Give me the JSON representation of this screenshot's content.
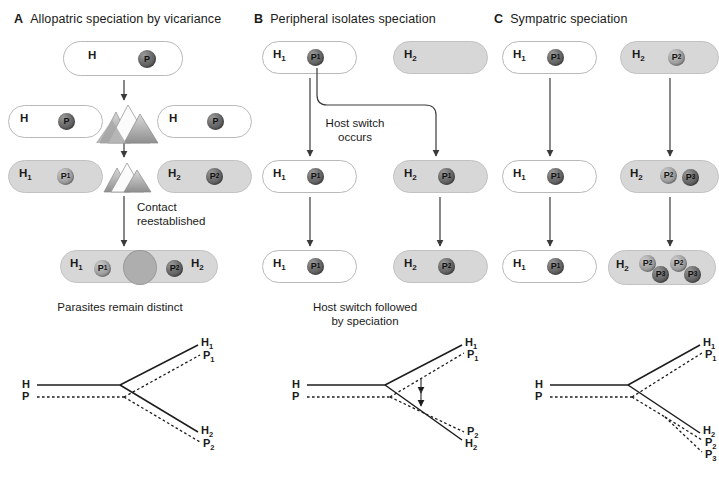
{
  "figure": {
    "panels": [
      {
        "letter": "A",
        "title": "Allopatric speciation by vicariance",
        "caption": "Parasites remain distinct",
        "arrow_labels": [
          "Contact\nreestablished"
        ],
        "stages": [
          {
            "hosts": [
              {
                "label": "H",
                "shaded": false,
                "parasites": [
                  {
                    "label": "P",
                    "tone": "dark"
                  }
                ]
              }
            ]
          },
          {
            "hosts": [
              {
                "label": "H",
                "shaded": false,
                "parasites": [
                  {
                    "label": "P",
                    "tone": "dark"
                  }
                ]
              },
              {
                "label": "H",
                "shaded": false,
                "parasites": [
                  {
                    "label": "P",
                    "tone": "dark"
                  }
                ]
              }
            ]
          },
          {
            "hosts": [
              {
                "label": "H1",
                "shaded": true,
                "parasites": [
                  {
                    "label": "P1",
                    "tone": "mid"
                  }
                ]
              },
              {
                "label": "H2",
                "shaded": true,
                "parasites": [
                  {
                    "label": "P2",
                    "tone": "dark"
                  }
                ]
              }
            ]
          },
          {
            "hosts": [
              {
                "label": "H1",
                "shaded": true,
                "parasites": [
                  {
                    "label": "P1",
                    "tone": "mid"
                  }
                ]
              },
              {
                "label": "H2",
                "shaded": true,
                "parasites": [
                  {
                    "label": "P2",
                    "tone": "dark"
                  }
                ]
              }
            ]
          }
        ],
        "tree": {
          "root_labels": [
            "H",
            "P"
          ],
          "tip_upper": [
            "H1",
            "P1"
          ],
          "tip_lower": [
            "H2",
            "P2"
          ],
          "host_line": "solid",
          "parasite_line": "dashed",
          "switch_arrows": 0
        }
      },
      {
        "letter": "B",
        "title": "Peripheral isolates speciation",
        "caption": "Host switch followed\nby speciation",
        "arrow_labels": [
          "Host switch\noccurs"
        ],
        "stages": [
          {
            "hosts": [
              {
                "label": "H1",
                "shaded": false,
                "parasites": [
                  {
                    "label": "P1",
                    "tone": "dark"
                  }
                ]
              },
              {
                "label": "H2",
                "shaded": true,
                "parasites": []
              }
            ]
          },
          {
            "hosts": [
              {
                "label": "H1",
                "shaded": false,
                "parasites": [
                  {
                    "label": "P1",
                    "tone": "dark"
                  }
                ]
              },
              {
                "label": "H2",
                "shaded": true,
                "parasites": [
                  {
                    "label": "P1",
                    "tone": "dark"
                  }
                ]
              }
            ]
          },
          {
            "hosts": [
              {
                "label": "H1",
                "shaded": false,
                "parasites": [
                  {
                    "label": "P1",
                    "tone": "dark"
                  }
                ]
              },
              {
                "label": "H2",
                "shaded": true,
                "parasites": [
                  {
                    "label": "P2",
                    "tone": "dark"
                  }
                ]
              }
            ]
          }
        ],
        "tree": {
          "root_labels": [
            "H",
            "P"
          ],
          "tip_upper": [
            "H1",
            "P1"
          ],
          "tip_lower": [
            "P2",
            "H2"
          ],
          "host_line": "solid",
          "parasite_line": "dashed",
          "switch_arrows": 2
        }
      },
      {
        "letter": "C",
        "title": "Sympatric speciation",
        "caption": "",
        "arrow_labels": [],
        "stages": [
          {
            "hosts": [
              {
                "label": "H1",
                "shaded": false,
                "parasites": [
                  {
                    "label": "P1",
                    "tone": "dark"
                  }
                ]
              },
              {
                "label": "H2",
                "shaded": true,
                "parasites": [
                  {
                    "label": "P2",
                    "tone": "mid"
                  }
                ]
              }
            ]
          },
          {
            "hosts": [
              {
                "label": "H1",
                "shaded": false,
                "parasites": [
                  {
                    "label": "P1",
                    "tone": "dark"
                  }
                ]
              },
              {
                "label": "H2",
                "shaded": true,
                "parasites": [
                  {
                    "label": "P2",
                    "tone": "mid"
                  },
                  {
                    "label": "P3",
                    "tone": "dark"
                  }
                ]
              }
            ]
          },
          {
            "hosts": [
              {
                "label": "H1",
                "shaded": false,
                "parasites": [
                  {
                    "label": "P1",
                    "tone": "dark"
                  }
                ]
              },
              {
                "label": "H2",
                "shaded": true,
                "parasites": [
                  {
                    "label": "P2",
                    "tone": "mid"
                  },
                  {
                    "label": "P3",
                    "tone": "dark"
                  },
                  {
                    "label": "P2",
                    "tone": "mid"
                  },
                  {
                    "label": "P3",
                    "tone": "dark"
                  }
                ]
              }
            ]
          }
        ],
        "tree": {
          "root_labels": [
            "H",
            "P"
          ],
          "tip_upper": [
            "H1",
            "P1"
          ],
          "tip_lower": [
            "H2",
            "P2",
            "P3"
          ],
          "host_line": "solid",
          "parasite_line": "dashed",
          "switch_arrows": 0
        }
      }
    ],
    "symbols": {
      "host_symbol": "H",
      "parasite_symbol": "P",
      "barrier_icon": "mountain-range-icon",
      "overlap_icon": "contact-zone-lens"
    },
    "colors": {
      "shaded_host_fill": "#d7d7d7",
      "light_host_fill": "#ffffff",
      "host_outline": "#b9b9b9",
      "parasite_dark": "#4a4a4a",
      "parasite_mid": "#a6a6a6",
      "line": "#3a3a3a",
      "text": "#1a1a1a",
      "background": "#ffffff"
    }
  }
}
